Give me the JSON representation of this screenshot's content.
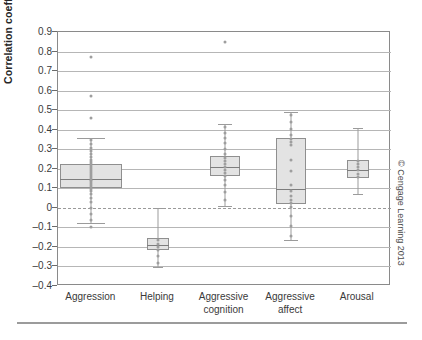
{
  "chart_data": {
    "type": "box",
    "title": "",
    "xlabel": "",
    "ylabel": "Correlation coefficient",
    "ylim": [
      -0.4,
      0.9
    ],
    "yticks": [
      0.9,
      0.8,
      0.7,
      0.6,
      0.5,
      0.4,
      0.3,
      0.2,
      0.1,
      0,
      -0.1,
      -0.2,
      -0.3,
      -0.4
    ],
    "ytick_labels": [
      "0.9",
      "0.8",
      "0.7",
      "0.6",
      "0.5",
      "0.4",
      "0.3",
      "0.2",
      "0.1",
      "0",
      "–0.1",
      "–0.2",
      "–0.3",
      "–0.4"
    ],
    "grid": true,
    "legend": "none",
    "reference_line": 0,
    "categories": [
      "Aggression",
      "Helping",
      "Aggressive cognition",
      "Aggressive affect",
      "Arousal"
    ],
    "category_labels": [
      "Aggression",
      "Helping",
      "Aggressive\ncognition",
      "Aggressive\naffect",
      "Arousal"
    ],
    "boxes": [
      {
        "category": "Aggression",
        "whisker_low": -0.08,
        "q1": 0.1,
        "median": 0.15,
        "q3": 0.225,
        "whisker_high": 0.36,
        "points": [
          0.345,
          0.325,
          0.305,
          0.29,
          0.275,
          0.26,
          0.245,
          0.235,
          0.225,
          0.215,
          0.205,
          0.195,
          0.185,
          0.175,
          0.165,
          0.155,
          0.145,
          0.135,
          0.125,
          0.115,
          0.105,
          0.095,
          0.085,
          0.07,
          0.05,
          0.03,
          0.0,
          -0.03,
          -0.06
        ],
        "outliers": [
          0.77,
          0.57,
          0.46,
          -0.1
        ]
      },
      {
        "category": "Helping",
        "whisker_low": -0.305,
        "q1": -0.215,
        "median": -0.19,
        "q3": -0.155,
        "whisker_high": 0.0,
        "points": [
          -0.165,
          -0.185,
          -0.2,
          -0.215,
          -0.245,
          -0.28
        ],
        "outliers": []
      },
      {
        "category": "Aggressive cognition",
        "whisker_low": 0.01,
        "q1": 0.165,
        "median": 0.21,
        "q3": 0.265,
        "whisker_high": 0.43,
        "points": [
          0.415,
          0.385,
          0.355,
          0.33,
          0.3,
          0.275,
          0.255,
          0.24,
          0.225,
          0.21,
          0.195,
          0.18,
          0.165,
          0.145,
          0.115,
          0.08,
          0.04
        ],
        "outliers": [
          0.85
        ]
      },
      {
        "category": "Aggressive affect",
        "whisker_low": -0.165,
        "q1": 0.02,
        "median": 0.095,
        "q3": 0.355,
        "whisker_high": 0.49,
        "points": [
          0.475,
          0.44,
          0.405,
          0.375,
          0.35,
          0.335,
          0.32,
          0.245,
          0.19,
          0.115,
          0.085,
          0.06,
          0.04,
          0.025,
          0.005,
          -0.04,
          -0.095,
          -0.145
        ],
        "outliers": []
      },
      {
        "category": "Arousal",
        "whisker_low": 0.07,
        "q1": 0.155,
        "median": 0.195,
        "q3": 0.245,
        "whisker_high": 0.41,
        "points": [
          0.24,
          0.225,
          0.21,
          0.195,
          0.175,
          0.16
        ],
        "outliers": []
      }
    ]
  },
  "credit": {
    "text": "© Cengage Learning 2013"
  }
}
